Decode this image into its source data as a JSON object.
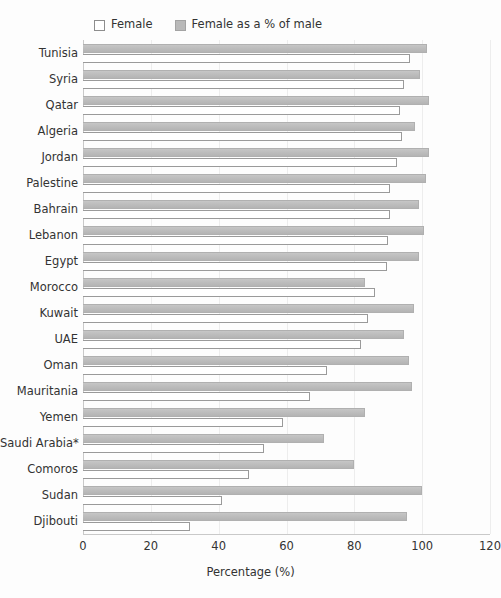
{
  "chart_data": {
    "type": "bar",
    "orientation": "horizontal",
    "title": "",
    "xlabel": "Percentage (%)",
    "ylabel": "",
    "xlim": [
      0,
      120
    ],
    "xticks": [
      0,
      20,
      40,
      60,
      80,
      100,
      120
    ],
    "grid": true,
    "grid_axis": "x",
    "legend_position": "top",
    "categories": [
      "Tunisia",
      "Syria",
      "Qatar",
      "Algeria",
      "Jordan",
      "Palestine",
      "Bahrain",
      "Lebanon",
      "Egypt",
      "Morocco",
      "Kuwait",
      "UAE",
      "Oman",
      "Mauritania",
      "Yemen",
      "Saudi Arabia*",
      "Comoros",
      "Sudan",
      "Djibouti"
    ],
    "series": [
      {
        "name": "Female as a % of male",
        "color": "#bdbdbd",
        "values": [
          101.5,
          99.5,
          102,
          98,
          102,
          101,
          99,
          100.5,
          99,
          83,
          97.5,
          94.5,
          96,
          97,
          83,
          71,
          80,
          100,
          95.5
        ]
      },
      {
        "name": "Female",
        "color": "#ffffff",
        "values": [
          96.5,
          94.5,
          93.5,
          94,
          92.5,
          90.5,
          90.5,
          90,
          89.5,
          86,
          84,
          82,
          72,
          67,
          59,
          53.5,
          49,
          41,
          31.5
        ]
      }
    ]
  },
  "legend": {
    "entries": [
      {
        "label": "Female",
        "swatch": "legend-swatch-female"
      },
      {
        "label": "Female as a % of male",
        "swatch": "legend-swatch-percent"
      }
    ]
  },
  "axis": {
    "x_title": "Percentage (%)",
    "x_tick_labels": [
      "0",
      "20",
      "40",
      "60",
      "80",
      "100",
      "120"
    ]
  },
  "colors": {
    "bar_percent_fill": "#bdbdbd",
    "bar_percent_border": "#b0b0b0",
    "bar_female_fill": "#ffffff",
    "bar_female_border": "#9a9a9a",
    "gridline": "#ededed",
    "axis": "#c9c9c9",
    "text": "#333333",
    "background": "#fdfdfd"
  }
}
